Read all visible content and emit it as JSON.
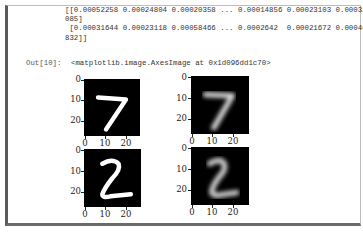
{
  "cell": {
    "stream_lines": [
      "[[0.00052258 0.00024804 0.00020358 ... 0.00014856 0.00023103 0.00032",
      "085]",
      " [0.00031644 0.00023118 0.00058466 ... 0.0002642  0.00021672 0.00040",
      "832]]"
    ],
    "out_prompt": "Out[10]:",
    "out_repr": "<matplotlib.image.AxesImage at 0x1d096dd1c70>"
  },
  "figure": {
    "subplots": [
      {
        "id": "original-7",
        "digit": "7",
        "style": "sharp",
        "yticks": [
          "0",
          "10",
          "20"
        ],
        "xticks": [
          "0",
          "10",
          "20"
        ]
      },
      {
        "id": "reconstructed-7",
        "digit": "7",
        "style": "blurred",
        "yticks": [
          "0",
          "10",
          "20"
        ],
        "xticks": [
          "0",
          "10",
          "20"
        ]
      },
      {
        "id": "original-2",
        "digit": "2",
        "style": "sharp",
        "yticks": [
          "0",
          "10",
          "20"
        ],
        "xticks": [
          "0",
          "10",
          "20"
        ]
      },
      {
        "id": "reconstructed-2",
        "digit": "2",
        "style": "blurred",
        "yticks": [
          "0",
          "10",
          "20"
        ],
        "xticks": [
          "0",
          "10",
          "20"
        ]
      }
    ]
  },
  "colors": {
    "frame_left": "#5a5a5a",
    "frame_border": "#bdbdbd",
    "image_bg": "#000000",
    "digit_stroke": "#ffffff"
  }
}
